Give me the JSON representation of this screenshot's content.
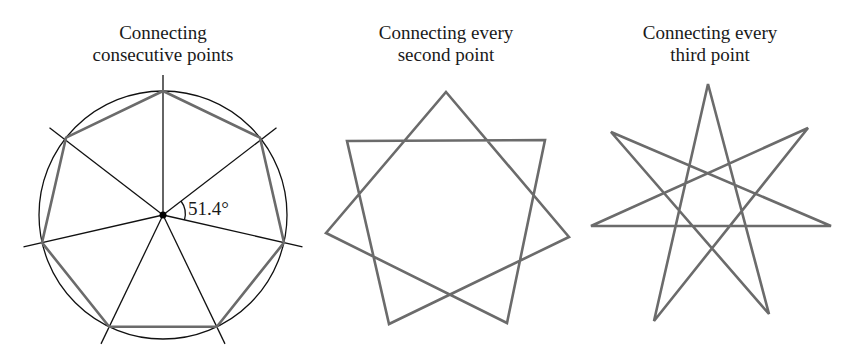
{
  "panels": [
    {
      "title_line1": "Connecting",
      "title_line2": "consecutive points",
      "shape": "heptagon",
      "angle_label": "51.4°"
    },
    {
      "title_line1": "Connecting every",
      "title_line2": "second point",
      "shape": "heptagram-7-2"
    },
    {
      "title_line1": "Connecting every",
      "title_line2": "third point",
      "shape": "heptagram-7-3"
    }
  ],
  "colors": {
    "polygon_stroke": "#6b6b6b",
    "construction_stroke": "#111111",
    "text": "#1a1a1a"
  }
}
